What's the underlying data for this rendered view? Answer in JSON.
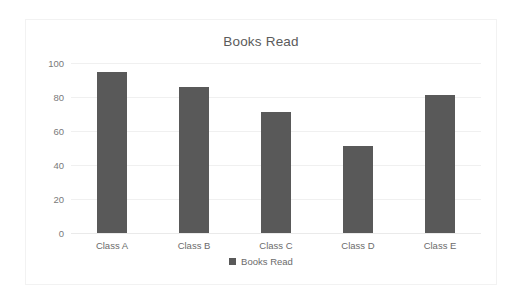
{
  "chart_data": {
    "type": "bar",
    "title": "Books Read",
    "categories": [
      "Class A",
      "Class B",
      "Class C",
      "Class D",
      "Class E"
    ],
    "values": [
      95,
      86,
      71,
      51,
      81
    ],
    "series": [
      {
        "name": "Books Read",
        "values": [
          95,
          86,
          71,
          51,
          81
        ]
      }
    ],
    "xlabel": "",
    "ylabel": "",
    "ylim": [
      0,
      100
    ],
    "yticks": [
      0,
      20,
      40,
      60,
      80,
      100
    ],
    "ytick_labels": [
      "0",
      "20",
      "40",
      "60",
      "80",
      "100"
    ],
    "grid": true,
    "legend": {
      "position": "bottom",
      "entries": [
        "Books Read"
      ]
    },
    "colors": {
      "bar": "#595959",
      "gridline": "#f0f0f0",
      "baseline": "#eaeaea",
      "border": "#f2f2f2",
      "title_text": "#5b5b5b",
      "tick_text": "#7a7a7a",
      "background": "#ffffff"
    }
  }
}
